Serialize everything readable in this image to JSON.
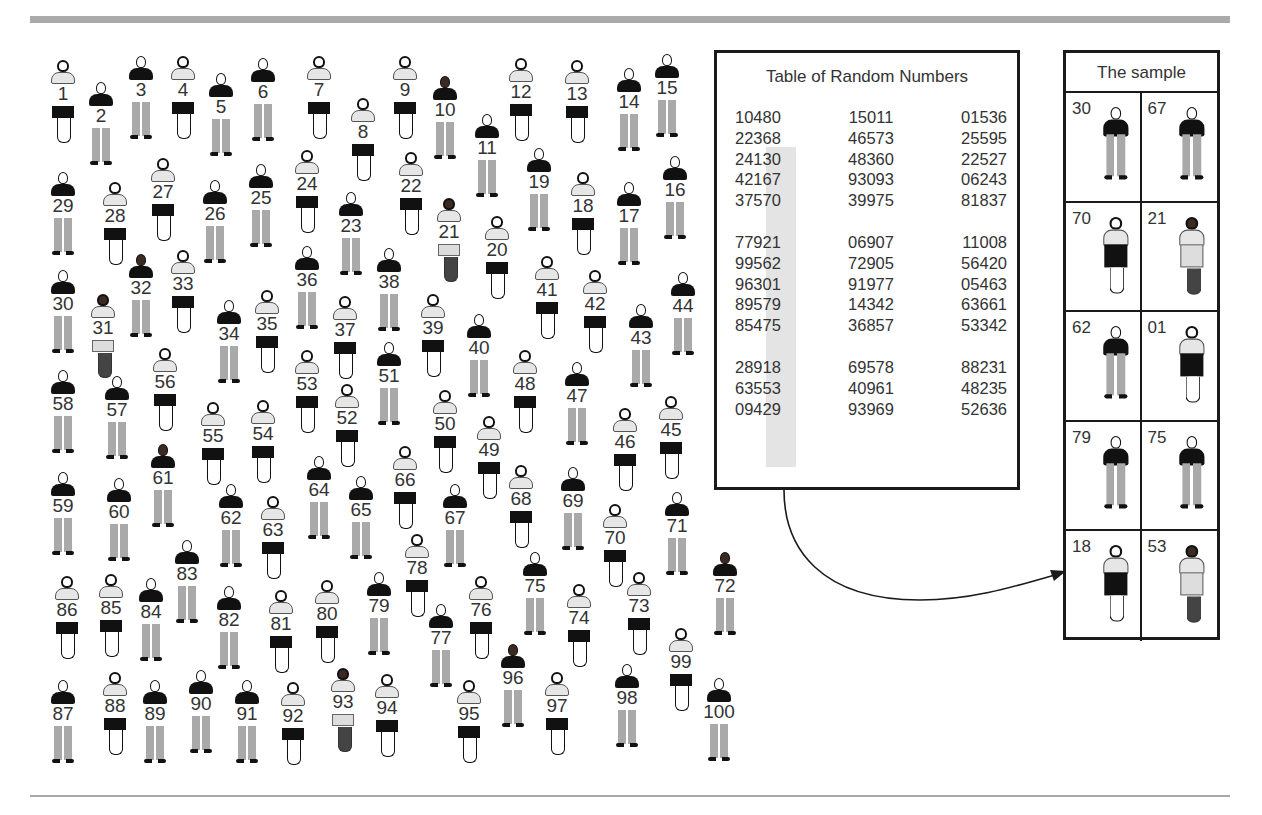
{
  "figure": {
    "population": [
      {
        "n": "1",
        "x": 46,
        "y": 60,
        "g": "female"
      },
      {
        "n": "2",
        "x": 84,
        "y": 82,
        "g": "male"
      },
      {
        "n": "3",
        "x": 124,
        "y": 56,
        "g": "male"
      },
      {
        "n": "4",
        "x": 166,
        "y": 56,
        "g": "female"
      },
      {
        "n": "5",
        "x": 204,
        "y": 73,
        "g": "male"
      },
      {
        "n": "6",
        "x": 246,
        "y": 58,
        "g": "male"
      },
      {
        "n": "7",
        "x": 302,
        "y": 56,
        "g": "female"
      },
      {
        "n": "8",
        "x": 346,
        "y": 98,
        "g": "female"
      },
      {
        "n": "9",
        "x": 388,
        "y": 56,
        "g": "female"
      },
      {
        "n": "10",
        "x": 428,
        "y": 76,
        "g": "male",
        "dark": true
      },
      {
        "n": "11",
        "x": 470,
        "y": 114,
        "g": "male"
      },
      {
        "n": "12",
        "x": 504,
        "y": 58,
        "g": "female"
      },
      {
        "n": "13",
        "x": 560,
        "y": 60,
        "g": "female"
      },
      {
        "n": "14",
        "x": 612,
        "y": 68,
        "g": "male"
      },
      {
        "n": "15",
        "x": 650,
        "y": 54,
        "g": "male"
      },
      {
        "n": "16",
        "x": 658,
        "y": 156,
        "g": "male"
      },
      {
        "n": "17",
        "x": 612,
        "y": 182,
        "g": "male"
      },
      {
        "n": "18",
        "x": 566,
        "y": 172,
        "g": "female"
      },
      {
        "n": "19",
        "x": 522,
        "y": 148,
        "g": "male"
      },
      {
        "n": "20",
        "x": 480,
        "y": 216,
        "g": "female"
      },
      {
        "n": "21",
        "x": 432,
        "y": 198,
        "g": "female",
        "dress": true,
        "dark": true
      },
      {
        "n": "22",
        "x": 394,
        "y": 152,
        "g": "female"
      },
      {
        "n": "23",
        "x": 334,
        "y": 192,
        "g": "male"
      },
      {
        "n": "24",
        "x": 290,
        "y": 150,
        "g": "female"
      },
      {
        "n": "25",
        "x": 244,
        "y": 164,
        "g": "male"
      },
      {
        "n": "26",
        "x": 198,
        "y": 180,
        "g": "male"
      },
      {
        "n": "27",
        "x": 146,
        "y": 158,
        "g": "female"
      },
      {
        "n": "28",
        "x": 98,
        "y": 182,
        "g": "female"
      },
      {
        "n": "29",
        "x": 46,
        "y": 172,
        "g": "male"
      },
      {
        "n": "30",
        "x": 46,
        "y": 270,
        "g": "male"
      },
      {
        "n": "31",
        "x": 86,
        "y": 294,
        "g": "female",
        "dress": true,
        "dark": true
      },
      {
        "n": "32",
        "x": 124,
        "y": 254,
        "g": "male",
        "dark": true
      },
      {
        "n": "33",
        "x": 166,
        "y": 250,
        "g": "female"
      },
      {
        "n": "34",
        "x": 212,
        "y": 300,
        "g": "male"
      },
      {
        "n": "35",
        "x": 250,
        "y": 290,
        "g": "female"
      },
      {
        "n": "36",
        "x": 290,
        "y": 246,
        "g": "male"
      },
      {
        "n": "37",
        "x": 328,
        "y": 296,
        "g": "female"
      },
      {
        "n": "38",
        "x": 372,
        "y": 248,
        "g": "male"
      },
      {
        "n": "39",
        "x": 416,
        "y": 294,
        "g": "female"
      },
      {
        "n": "40",
        "x": 462,
        "y": 314,
        "g": "male"
      },
      {
        "n": "41",
        "x": 530,
        "y": 256,
        "g": "female"
      },
      {
        "n": "42",
        "x": 578,
        "y": 270,
        "g": "female"
      },
      {
        "n": "43",
        "x": 624,
        "y": 304,
        "g": "male"
      },
      {
        "n": "44",
        "x": 666,
        "y": 272,
        "g": "male"
      },
      {
        "n": "45",
        "x": 654,
        "y": 396,
        "g": "female"
      },
      {
        "n": "46",
        "x": 608,
        "y": 408,
        "g": "female"
      },
      {
        "n": "47",
        "x": 560,
        "y": 362,
        "g": "male"
      },
      {
        "n": "48",
        "x": 508,
        "y": 350,
        "g": "female"
      },
      {
        "n": "49",
        "x": 472,
        "y": 416,
        "g": "female"
      },
      {
        "n": "50",
        "x": 428,
        "y": 390,
        "g": "female"
      },
      {
        "n": "51",
        "x": 372,
        "y": 342,
        "g": "male"
      },
      {
        "n": "52",
        "x": 330,
        "y": 384,
        "g": "female"
      },
      {
        "n": "53",
        "x": 290,
        "y": 350,
        "g": "female"
      },
      {
        "n": "54",
        "x": 246,
        "y": 400,
        "g": "female"
      },
      {
        "n": "55",
        "x": 196,
        "y": 402,
        "g": "female"
      },
      {
        "n": "56",
        "x": 148,
        "y": 348,
        "g": "female"
      },
      {
        "n": "57",
        "x": 100,
        "y": 376,
        "g": "male"
      },
      {
        "n": "58",
        "x": 46,
        "y": 370,
        "g": "male"
      },
      {
        "n": "59",
        "x": 46,
        "y": 472,
        "g": "male"
      },
      {
        "n": "60",
        "x": 102,
        "y": 478,
        "g": "male"
      },
      {
        "n": "61",
        "x": 146,
        "y": 444,
        "g": "male",
        "dark": true
      },
      {
        "n": "62",
        "x": 214,
        "y": 484,
        "g": "male"
      },
      {
        "n": "63",
        "x": 256,
        "y": 496,
        "g": "female"
      },
      {
        "n": "64",
        "x": 302,
        "y": 456,
        "g": "male"
      },
      {
        "n": "65",
        "x": 344,
        "y": 476,
        "g": "male"
      },
      {
        "n": "66",
        "x": 388,
        "y": 446,
        "g": "female"
      },
      {
        "n": "67",
        "x": 438,
        "y": 484,
        "g": "male"
      },
      {
        "n": "68",
        "x": 504,
        "y": 465,
        "g": "female"
      },
      {
        "n": "69",
        "x": 556,
        "y": 467,
        "g": "male"
      },
      {
        "n": "70",
        "x": 598,
        "y": 504,
        "g": "female"
      },
      {
        "n": "71",
        "x": 660,
        "y": 492,
        "g": "male"
      },
      {
        "n": "72",
        "x": 708,
        "y": 552,
        "g": "male",
        "dark": true
      },
      {
        "n": "73",
        "x": 622,
        "y": 572,
        "g": "female"
      },
      {
        "n": "74",
        "x": 562,
        "y": 584,
        "g": "female"
      },
      {
        "n": "75",
        "x": 518,
        "y": 552,
        "g": "male"
      },
      {
        "n": "76",
        "x": 464,
        "y": 576,
        "g": "female"
      },
      {
        "n": "77",
        "x": 424,
        "y": 604,
        "g": "male"
      },
      {
        "n": "78",
        "x": 400,
        "y": 534,
        "g": "female"
      },
      {
        "n": "79",
        "x": 362,
        "y": 572,
        "g": "male"
      },
      {
        "n": "80",
        "x": 310,
        "y": 580,
        "g": "female"
      },
      {
        "n": "81",
        "x": 264,
        "y": 590,
        "g": "female"
      },
      {
        "n": "82",
        "x": 212,
        "y": 586,
        "g": "male"
      },
      {
        "n": "83",
        "x": 170,
        "y": 540,
        "g": "male"
      },
      {
        "n": "84",
        "x": 134,
        "y": 578,
        "g": "male"
      },
      {
        "n": "85",
        "x": 94,
        "y": 574,
        "g": "female"
      },
      {
        "n": "86",
        "x": 50,
        "y": 576,
        "g": "female"
      },
      {
        "n": "87",
        "x": 46,
        "y": 680,
        "g": "male"
      },
      {
        "n": "88",
        "x": 98,
        "y": 672,
        "g": "female"
      },
      {
        "n": "89",
        "x": 138,
        "y": 680,
        "g": "male"
      },
      {
        "n": "90",
        "x": 184,
        "y": 670,
        "g": "male"
      },
      {
        "n": "91",
        "x": 230,
        "y": 680,
        "g": "male"
      },
      {
        "n": "92",
        "x": 276,
        "y": 682,
        "g": "female"
      },
      {
        "n": "93",
        "x": 326,
        "y": 668,
        "g": "female",
        "dress": true,
        "dark": true
      },
      {
        "n": "94",
        "x": 370,
        "y": 674,
        "g": "female"
      },
      {
        "n": "95",
        "x": 452,
        "y": 680,
        "g": "female"
      },
      {
        "n": "96",
        "x": 496,
        "y": 644,
        "g": "male",
        "dark": true
      },
      {
        "n": "97",
        "x": 540,
        "y": 672,
        "g": "female"
      },
      {
        "n": "98",
        "x": 610,
        "y": 664,
        "g": "male"
      },
      {
        "n": "99",
        "x": 664,
        "y": 628,
        "g": "female"
      },
      {
        "n": "100",
        "x": 702,
        "y": 678,
        "g": "male"
      }
    ],
    "random_table": {
      "title": "Table of Random Numbers",
      "blocks": [
        [
          [
            "10480",
            "15011",
            "01536"
          ],
          [
            "22368",
            "46573",
            "25595"
          ],
          [
            "24130",
            "48360",
            "22527"
          ],
          [
            "42167",
            "93093",
            "06243"
          ],
          [
            "37570",
            "39975",
            "81837"
          ]
        ],
        [
          [
            "77921",
            "06907",
            "11008"
          ],
          [
            "99562",
            "72905",
            "56420"
          ],
          [
            "96301",
            "91977",
            "05463"
          ],
          [
            "89579",
            "14342",
            "63661"
          ],
          [
            "85475",
            "36857",
            "53342"
          ]
        ],
        [
          [
            "28918",
            "69578",
            "88231"
          ],
          [
            "63553",
            "40961",
            "48235"
          ],
          [
            "09429",
            "93969",
            "52636"
          ]
        ]
      ]
    },
    "sample": {
      "title": "The sample",
      "members": [
        {
          "n": "30",
          "g": "male"
        },
        {
          "n": "67",
          "g": "male"
        },
        {
          "n": "70",
          "g": "female"
        },
        {
          "n": "21",
          "g": "female",
          "dress": true,
          "dark": true
        },
        {
          "n": "62",
          "g": "male"
        },
        {
          "n": "01",
          "g": "female"
        },
        {
          "n": "79",
          "g": "male"
        },
        {
          "n": "75",
          "g": "male"
        },
        {
          "n": "18",
          "g": "female"
        },
        {
          "n": "53",
          "g": "female",
          "dress": true,
          "dark": true
        }
      ]
    }
  }
}
